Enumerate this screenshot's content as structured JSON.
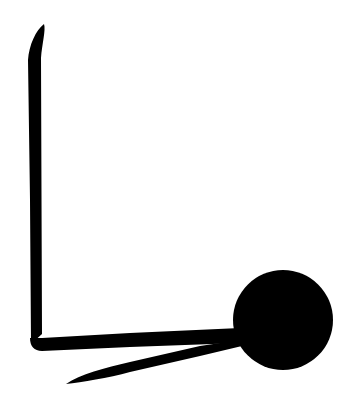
{
  "canvas": {
    "width": 352,
    "height": 406,
    "background": "#ffffff",
    "ink_color": "#000000"
  },
  "figure": {
    "parts": [
      "vertical-stroke",
      "horizontal-base",
      "circle",
      "diagonal-stroke"
    ]
  }
}
